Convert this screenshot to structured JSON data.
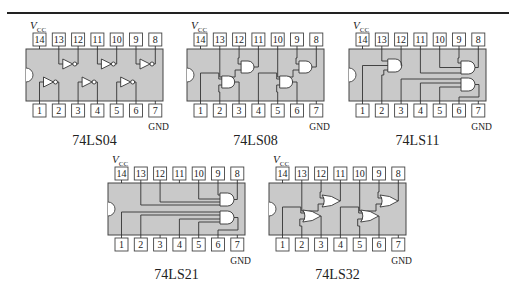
{
  "figure": {
    "top_rule": true,
    "vcc_label": "V",
    "vcc_sub": "CC",
    "gnd_label": "GND",
    "colors": {
      "chip_body": "#c9c9c9",
      "pin_fill": "#ffffff",
      "line": "#333333"
    },
    "chips": [
      {
        "id": "74LS04",
        "label": "74LS04",
        "gate_type": "NOT",
        "gates": 6,
        "top_pins": [
          "14",
          "13",
          "12",
          "11",
          "10",
          "9",
          "8"
        ],
        "bottom_pins": [
          "1",
          "2",
          "3",
          "4",
          "5",
          "6",
          "7"
        ]
      },
      {
        "id": "74LS08",
        "label": "74LS08",
        "gate_type": "AND",
        "gates": 4,
        "inputs_per_gate": 2,
        "top_pins": [
          "14",
          "13",
          "12",
          "11",
          "10",
          "9",
          "8"
        ],
        "bottom_pins": [
          "1",
          "2",
          "3",
          "4",
          "5",
          "6",
          "7"
        ]
      },
      {
        "id": "74LS11",
        "label": "74LS11",
        "gate_type": "AND",
        "gates": 3,
        "inputs_per_gate": 3,
        "top_pins": [
          "14",
          "13",
          "12",
          "11",
          "10",
          "9",
          "8"
        ],
        "bottom_pins": [
          "1",
          "2",
          "3",
          "4",
          "5",
          "6",
          "7"
        ]
      },
      {
        "id": "74LS21",
        "label": "74LS21",
        "gate_type": "AND",
        "gates": 2,
        "inputs_per_gate": 4,
        "top_pins": [
          "14",
          "13",
          "12",
          "11",
          "10",
          "9",
          "8"
        ],
        "bottom_pins": [
          "1",
          "2",
          "3",
          "4",
          "5",
          "6",
          "7"
        ]
      },
      {
        "id": "74LS32",
        "label": "74LS32",
        "gate_type": "OR",
        "gates": 4,
        "inputs_per_gate": 2,
        "top_pins": [
          "14",
          "13",
          "12",
          "11",
          "10",
          "9",
          "8"
        ],
        "bottom_pins": [
          "1",
          "2",
          "3",
          "4",
          "5",
          "6",
          "7"
        ]
      }
    ]
  }
}
